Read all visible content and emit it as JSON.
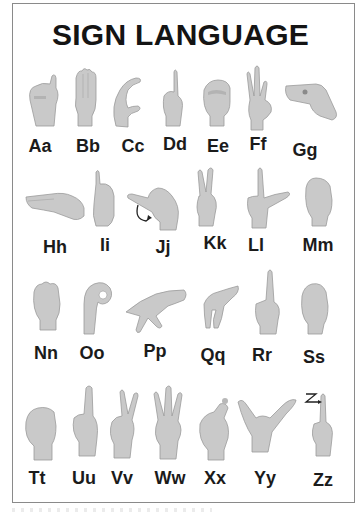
{
  "poster": {
    "title": "SIGN LANGUAGE",
    "colors": {
      "text": "#141414",
      "frame": "#8a8a8a",
      "hand": "#c9c9c9",
      "background": "#ffffff"
    },
    "rows": [
      {
        "letters": [
          {
            "label": "Aa",
            "x": 40,
            "y": 136,
            "icon": "hand-sign-a-icon"
          },
          {
            "label": "Bb",
            "x": 88,
            "y": 136,
            "icon": "hand-sign-b-icon"
          },
          {
            "label": "Cc",
            "x": 133,
            "y": 136,
            "icon": "hand-sign-c-icon"
          },
          {
            "label": "Dd",
            "x": 175,
            "y": 134,
            "icon": "hand-sign-d-icon"
          },
          {
            "label": "Ee",
            "x": 218,
            "y": 136,
            "icon": "hand-sign-e-icon"
          },
          {
            "label": "Ff",
            "x": 258,
            "y": 134,
            "icon": "hand-sign-f-icon"
          },
          {
            "label": "Gg",
            "x": 305,
            "y": 140,
            "icon": "hand-sign-g-icon"
          }
        ]
      },
      {
        "letters": [
          {
            "label": "Hh",
            "x": 55,
            "y": 237,
            "icon": "hand-sign-h-icon"
          },
          {
            "label": "Ii",
            "x": 105,
            "y": 235,
            "icon": "hand-sign-i-icon"
          },
          {
            "label": "Jj",
            "x": 163,
            "y": 237,
            "icon": "hand-sign-j-icon"
          },
          {
            "label": "Kk",
            "x": 215,
            "y": 233,
            "icon": "hand-sign-k-icon"
          },
          {
            "label": "Ll",
            "x": 256,
            "y": 235,
            "icon": "hand-sign-l-icon"
          },
          {
            "label": "Mm",
            "x": 318,
            "y": 235,
            "icon": "hand-sign-m-icon"
          }
        ]
      },
      {
        "letters": [
          {
            "label": "Nn",
            "x": 46,
            "y": 343,
            "icon": "hand-sign-n-icon"
          },
          {
            "label": "Oo",
            "x": 92,
            "y": 343,
            "icon": "hand-sign-o-icon"
          },
          {
            "label": "Pp",
            "x": 155,
            "y": 341,
            "icon": "hand-sign-p-icon"
          },
          {
            "label": "Qq",
            "x": 213,
            "y": 345,
            "icon": "hand-sign-q-icon"
          },
          {
            "label": "Rr",
            "x": 262,
            "y": 345,
            "icon": "hand-sign-r-icon"
          },
          {
            "label": "Ss",
            "x": 314,
            "y": 347,
            "icon": "hand-sign-s-icon"
          }
        ]
      },
      {
        "letters": [
          {
            "label": "Tt",
            "x": 37,
            "y": 468,
            "icon": "hand-sign-t-icon"
          },
          {
            "label": "Uu",
            "x": 84,
            "y": 468,
            "icon": "hand-sign-u-icon"
          },
          {
            "label": "Vv",
            "x": 122,
            "y": 468,
            "icon": "hand-sign-v-icon"
          },
          {
            "label": "Ww",
            "x": 170,
            "y": 468,
            "icon": "hand-sign-w-icon"
          },
          {
            "label": "Xx",
            "x": 215,
            "y": 468,
            "icon": "hand-sign-x-icon"
          },
          {
            "label": "Yy",
            "x": 265,
            "y": 468,
            "icon": "hand-sign-y-icon"
          },
          {
            "label": "Zz",
            "x": 323,
            "y": 470,
            "icon": "hand-sign-z-icon"
          }
        ]
      }
    ]
  }
}
